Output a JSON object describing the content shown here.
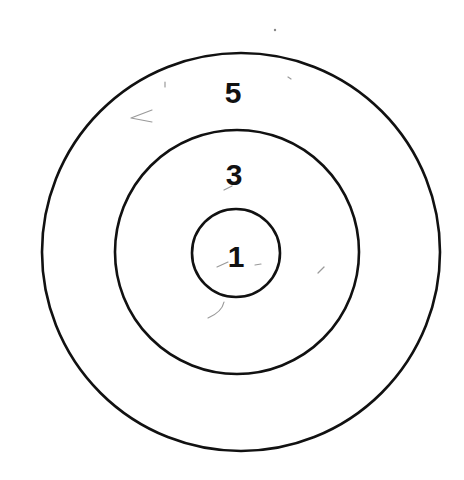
{
  "diagram": {
    "type": "concentric-circles-target",
    "rings": [
      {
        "name": "outer",
        "label": "5",
        "cx": 241,
        "cy": 252,
        "r": 199,
        "label_x": 233,
        "label_y": 92
      },
      {
        "name": "middle",
        "label": "3",
        "cx": 237,
        "cy": 252,
        "r": 122,
        "label_x": 234,
        "label_y": 174
      },
      {
        "name": "inner",
        "label": "1",
        "cx": 236,
        "cy": 253,
        "r": 44,
        "label_x": 236,
        "label_y": 256
      }
    ],
    "colors": {
      "stroke": "#111111",
      "background": "#ffffff"
    }
  }
}
